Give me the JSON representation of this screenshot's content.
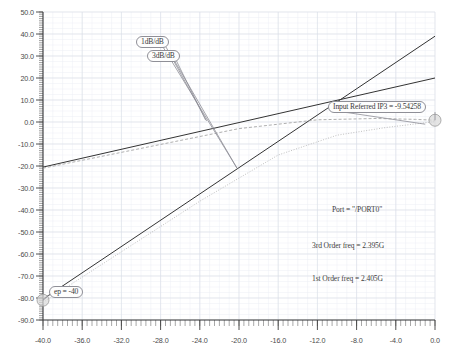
{
  "chart_data": {
    "type": "line",
    "title": "",
    "xlabel": "",
    "ylabel": "",
    "xlim": [
      -40.0,
      0.0
    ],
    "ylim": [
      -90.0,
      50.0
    ],
    "xticks": [
      "-40.0",
      "-36.0",
      "-32.0",
      "-28.0",
      "-24.0",
      "-20.0",
      "-16.0",
      "-12.0",
      "-8.0",
      "-4.0",
      "0.0"
    ],
    "yticks": [
      "50.0",
      "40.0",
      "30.0",
      "20.0",
      "10.0",
      "0.0",
      "-10.0",
      "-20.0",
      "-30.0",
      "-40.0",
      "-50.0",
      "-60.0",
      "-70.0",
      "-80.0",
      "-90.0"
    ],
    "grid": true,
    "legend": "none",
    "series": [
      {
        "name": "1st order extrapolation",
        "style": "solid",
        "color": "#333333",
        "slope": 1,
        "points": [
          [
            -40.0,
            -20.5
          ],
          [
            0.0,
            20.0
          ]
        ]
      },
      {
        "name": "3rd order extrapolation",
        "style": "solid",
        "color": "#333333",
        "slope": 3,
        "points": [
          [
            -40.0,
            -80.5
          ],
          [
            0.0,
            39.0
          ]
        ]
      },
      {
        "name": "1st order measured",
        "style": "dashed",
        "color": "#9a9a9a",
        "points": [
          [
            -40.0,
            -21.0
          ],
          [
            -20.0,
            -3.0
          ],
          [
            -12.0,
            1.0
          ],
          [
            -6.0,
            1.6
          ],
          [
            -2.0,
            1.2
          ],
          [
            0.0,
            0.8
          ]
        ]
      },
      {
        "name": "3rd order measured",
        "style": "dotted",
        "color": "#b0b0b0",
        "points": [
          [
            -40.0,
            -82.0
          ],
          [
            -24.0,
            -36.0
          ],
          [
            -16.0,
            -15.0
          ],
          [
            -10.0,
            -6.0
          ],
          [
            -5.0,
            -2.5
          ],
          [
            0.0,
            0.2
          ]
        ]
      }
    ],
    "markers": [
      {
        "name": "ip3-intercept-marker",
        "x": 0.0,
        "y": 0.8
      },
      {
        "name": "sweep-start-marker",
        "x": -40.0,
        "y": -81.0
      }
    ],
    "annotations": [
      {
        "name": "slope-1db-callout",
        "text": "1dB/dB",
        "x": -28.3,
        "y": 33.0
      },
      {
        "name": "slope-3db-callout",
        "text": "3dB/dB",
        "x": -27.2,
        "y": 28.4
      },
      {
        "name": "ip3-callout",
        "text": "Input Referred IP3 = -9.54258",
        "x": -10.5,
        "y": 3.0
      },
      {
        "name": "sweep-start-callout",
        "text": "ep = -40",
        "x": -37.6,
        "y": -77.0
      },
      {
        "name": "port-annotation",
        "text": "Port = \"/PORT0\"",
        "x": -9.7,
        "y": -39.0
      },
      {
        "name": "third-order-freq-annotation",
        "text": "3rd Order freq = 2.395G",
        "x": -10.3,
        "y": -55.5
      },
      {
        "name": "first-order-freq-annotation",
        "text": "1st Order freq = 2.405G",
        "x": -10.3,
        "y": -70.5
      }
    ]
  },
  "axes": {
    "x_tick_labels": [
      "-40.0",
      "-36.0",
      "-32.0",
      "-28.0",
      "-24.0",
      "-20.0",
      "-16.0",
      "-12.0",
      "-8.0",
      "-4.0",
      "0.0"
    ],
    "y_tick_labels": [
      "50.0",
      "40.0",
      "30.0",
      "20.0",
      "10.0",
      "0.0",
      "-10.0",
      "-20.0",
      "-30.0",
      "-40.0",
      "-50.0",
      "-60.0",
      "-70.0",
      "-80.0",
      "-90.0"
    ]
  },
  "callouts": {
    "slope_1db": "1dB/dB",
    "slope_3db": "3dB/dB",
    "ip3": "Input Referred IP3 = -9.54258",
    "sweep_start": "ep = -40"
  },
  "annotations": {
    "port": "Port = \"/PORT0\"",
    "third_order_freq": "3rd Order freq = 2.395G",
    "first_order_freq": "1st Order freq = 2.405G"
  },
  "colors": {
    "grid_major": "#d8dce4",
    "grid_minor": "#eceef3",
    "axis": "#3c3c3c",
    "curve_dark": "#333333",
    "curve_light": "#a8a8a8",
    "text": "#4a4a4a",
    "background": "#ffffff"
  }
}
